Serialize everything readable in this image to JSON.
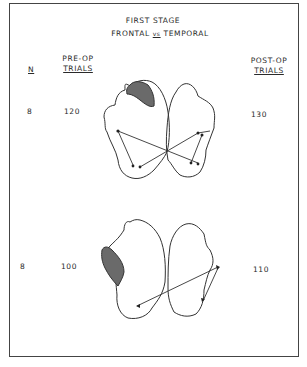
{
  "title": {
    "line1": "FIRST STAGE",
    "line2": "FRONTAL vs TEMPORAL"
  },
  "columns": {
    "n": "N",
    "pre_op": [
      "PRE-OP",
      "TRIALS"
    ],
    "post_op": [
      "POST-OP",
      "TRIALS"
    ]
  },
  "rows": [
    {
      "n": "8",
      "pre_op_trials": "120",
      "post_op_trials": "130",
      "lesion": "frontal"
    },
    {
      "n": "8",
      "pre_op_trials": "100",
      "post_op_trials": "110",
      "lesion": "temporal"
    }
  ],
  "colors": {
    "line": "#333333",
    "lesion_fill": "#6a6a6a",
    "frame": "#444444"
  }
}
